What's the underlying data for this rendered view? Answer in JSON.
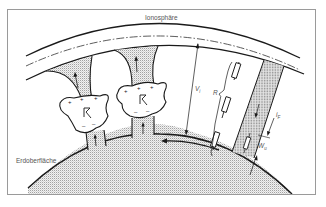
{
  "diagram": {
    "type": "atmospheric-electricity-circuit",
    "labels": {
      "ionosphere": "Ionosphäre",
      "earth_surface": "Erdoberfläche",
      "potential": "V",
      "potential_sub": "i",
      "resistance": "R",
      "current": "i",
      "current_sub": "F",
      "layer_width": "W",
      "layer_width_sub": "u"
    },
    "elements": {
      "thunderclouds": [
        {
          "id": "cloud-1",
          "top_charge": "+ + +",
          "bottom_charge": "– – –",
          "symbol": "lightning"
        },
        {
          "id": "cloud-2",
          "top_charge": "+ + +",
          "bottom_charge": "– – –",
          "symbol": "lightning"
        }
      ],
      "resistors_count": 3
    },
    "colors": {
      "line": "#1a1a1a",
      "frame": "#9a9a9a",
      "stipple": "#c8c8c8",
      "text": "#555555"
    }
  }
}
